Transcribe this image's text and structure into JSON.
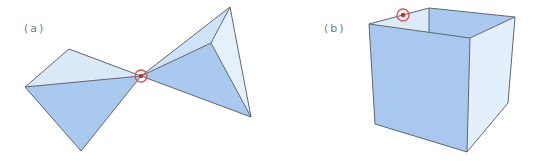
{
  "panels": [
    {
      "id": "a",
      "label": "(a)",
      "label_pos": {
        "x": 24,
        "y": 22
      },
      "description": "Two tetrahedra (bow-tie) touching at a single vertex",
      "faces": [
        {
          "points": "25,87 69,49 141,76",
          "fill": "#d9e9f8"
        },
        {
          "points": "25,87 141,76 81,151",
          "fill": "#a9c9ef"
        },
        {
          "points": "141,76 230,7 211,43",
          "fill": "#cfe3f6"
        },
        {
          "points": "141,76 211,43 251,117",
          "fill": "#a9c9ef"
        },
        {
          "points": "211,43 230,7 251,117",
          "fill": "#e4f1fb"
        }
      ],
      "edges": [
        "25,87 69,49 141,76 81,151 25,87",
        "25,87 141,76",
        "141,76 230,7 251,117 141,76",
        "141,76 211,43",
        "211,43 230,7",
        "211,43 251,117"
      ],
      "marker": {
        "cx": 141,
        "cy": 76,
        "r": 6
      }
    },
    {
      "id": "b",
      "label": "(b)",
      "label_pos": {
        "x": 324,
        "y": 22
      },
      "description": "Open-top cube with a marked point on its rim",
      "faces": [
        {
          "points": "369,24 429,8 429,33 369,24",
          "fill": "#dcebf8"
        },
        {
          "points": "429,8 515,17 470,38 429,33",
          "fill": "#a9c9ef"
        },
        {
          "points": "470,38 515,17 508,103 467,152",
          "fill": "#e3f0fb"
        },
        {
          "points": "369,24 470,38 467,152 375,124",
          "fill": "#a8c8ef"
        }
      ],
      "edges": [
        "369,24 429,8 515,17",
        "429,8 429,33",
        "369,24 470,38 515,17",
        "369,24 375,124 467,152 470,38",
        "467,152 508,103 515,17"
      ],
      "marker": {
        "cx": 403,
        "cy": 15,
        "r": 6
      }
    }
  ],
  "colors": {
    "edge": "#5f6670",
    "marker": "#d9534f",
    "face_dark": "#a9c9ef",
    "face_light": "#d9e9f8",
    "face_lightest": "#e4f1fb"
  }
}
